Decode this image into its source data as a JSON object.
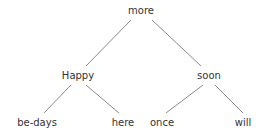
{
  "diagram": {
    "type": "binary-tree",
    "background_color": "#ffffff",
    "edge_color": "#8a8a8a",
    "text_color": "#333333",
    "nodes": [
      {
        "id": "root",
        "label": "more",
        "x": 141,
        "y": 11,
        "level": 0
      },
      {
        "id": "left",
        "label": "Happy",
        "x": 78,
        "y": 76,
        "level": 1
      },
      {
        "id": "right",
        "label": "soon",
        "x": 209,
        "y": 76,
        "level": 1
      },
      {
        "id": "leaf1",
        "label": "be-days",
        "x": 37,
        "y": 123,
        "level": 2
      },
      {
        "id": "leaf2",
        "label": "here",
        "x": 123,
        "y": 123,
        "level": 2
      },
      {
        "id": "leaf3",
        "label": "once",
        "x": 162,
        "y": 123,
        "level": 2
      },
      {
        "id": "leaf4",
        "label": "will",
        "x": 243,
        "y": 123,
        "level": 2
      }
    ],
    "edges": [
      {
        "id": "edge-root-left",
        "from": "root",
        "to": "left",
        "x1": 131,
        "y1": 20,
        "x2": 86,
        "y2": 66
      },
      {
        "id": "edge-root-right",
        "from": "root",
        "to": "right",
        "x1": 152,
        "y1": 20,
        "x2": 201,
        "y2": 66
      },
      {
        "id": "edge-left-leaf1",
        "from": "left",
        "to": "leaf1",
        "x1": 71,
        "y1": 85,
        "x2": 44,
        "y2": 113
      },
      {
        "id": "edge-left-leaf2",
        "from": "left",
        "to": "leaf2",
        "x1": 86,
        "y1": 85,
        "x2": 119,
        "y2": 113
      },
      {
        "id": "edge-right-leaf3",
        "from": "right",
        "to": "leaf3",
        "x1": 203,
        "y1": 85,
        "x2": 166,
        "y2": 113
      },
      {
        "id": "edge-right-leaf4",
        "from": "right",
        "to": "leaf4",
        "x1": 215,
        "y1": 85,
        "x2": 243,
        "y2": 113
      }
    ]
  }
}
